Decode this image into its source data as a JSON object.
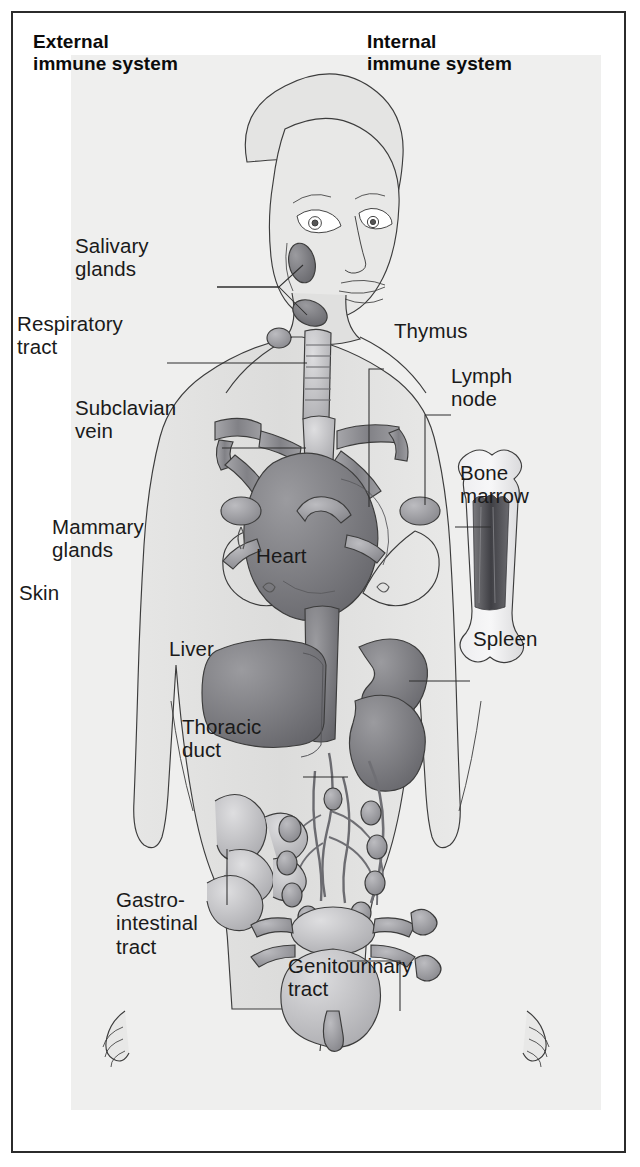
{
  "figure": {
    "kind": "anatomical-diagram",
    "headers": {
      "left": "External\nimmune system",
      "right": "Internal\nimmune system"
    },
    "palette": {
      "page_background": "#ffffff",
      "frame_border": "#2b2b2b",
      "panel_background": "#efefee",
      "body_fill": "#e2e2e1",
      "outline": "#3c3c3c",
      "label_text": "#1a1a1a",
      "organ_dark": "#6f6f72",
      "organ_mid": "#9a9a9d",
      "organ_light": "#c3c3c5",
      "marrow_dark": "#4a4a4e",
      "leader_line": "#2f2f2f"
    },
    "labels": [
      {
        "id": "salivary-glands",
        "text": "Salivary\nglands",
        "side": "left",
        "x": 124,
        "y": 263,
        "align": "left"
      },
      {
        "id": "respiratory-tract",
        "text": "Respiratory\ntract",
        "side": "left",
        "x": 66,
        "y": 341,
        "align": "left"
      },
      {
        "id": "subclavian-vein",
        "text": "Subclavian\nvein",
        "side": "left",
        "x": 124,
        "y": 425,
        "align": "left"
      },
      {
        "id": "mammary-glands",
        "text": "Mammary\nglands",
        "side": "left",
        "x": 101,
        "y": 544,
        "align": "left"
      },
      {
        "id": "skin",
        "text": "Skin",
        "side": "left",
        "x": 68,
        "y": 610,
        "align": "left"
      },
      {
        "id": "liver",
        "text": "Liver",
        "side": "organ",
        "x": 218,
        "y": 666,
        "align": "left"
      },
      {
        "id": "heart",
        "text": "Heart",
        "side": "organ",
        "x": 305,
        "y": 573,
        "align": "left"
      },
      {
        "id": "thoracic-duct",
        "text": "Thoracic\nduct",
        "side": "left",
        "x": 231,
        "y": 744,
        "align": "left"
      },
      {
        "id": "gastro-intestinal",
        "text": "Gastro-\nintestinal\ntract",
        "side": "left",
        "x": 165,
        "y": 917,
        "align": "left"
      },
      {
        "id": "thymus",
        "text": "Thymus",
        "side": "right",
        "x": 443,
        "y": 348,
        "align": "left"
      },
      {
        "id": "lymph-node",
        "text": "Lymph\nnode",
        "side": "right",
        "x": 500,
        "y": 393,
        "align": "left"
      },
      {
        "id": "bone-marrow",
        "text": "Bone\nmarrow",
        "side": "right",
        "x": 509,
        "y": 490,
        "align": "left"
      },
      {
        "id": "spleen",
        "text": "Spleen",
        "side": "right",
        "x": 522,
        "y": 656,
        "align": "left"
      },
      {
        "id": "genitourinary-tract",
        "text": "Genitourinary\ntract",
        "side": "right",
        "x": 337,
        "y": 983,
        "align": "left"
      }
    ],
    "organs": [
      "salivary glands",
      "respiratory tract",
      "subclavian vein",
      "mammary glands",
      "skin",
      "thymus",
      "lymph node",
      "bone marrow",
      "heart",
      "liver",
      "spleen",
      "thoracic duct",
      "gastrointestinal tract",
      "genitourinary tract"
    ]
  }
}
